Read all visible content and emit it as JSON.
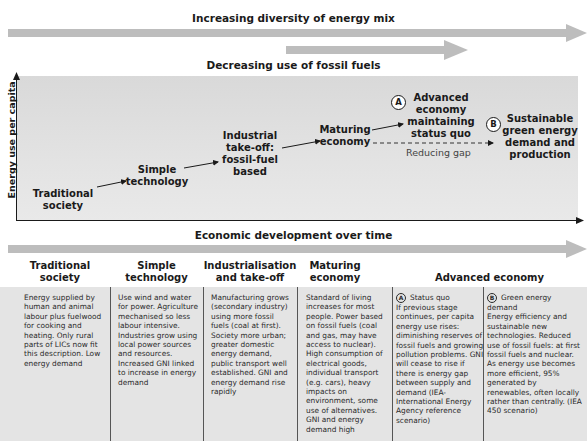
{
  "top_arrows": {
    "diversity": {
      "label": "Increasing diversity of energy mix",
      "color": "#bdbdbd"
    },
    "fossil": {
      "label": "Decreasing use of fossil fuels",
      "color": "#bdbdbd"
    }
  },
  "chart": {
    "y_axis_label": "Energy use per capita",
    "stages": [
      {
        "id": "traditional",
        "lines": [
          "Traditional",
          "society"
        ]
      },
      {
        "id": "simple",
        "lines": [
          "Simple",
          "technology"
        ]
      },
      {
        "id": "industrial",
        "lines": [
          "Industrial",
          "take-off:",
          "fossil-fuel",
          "based"
        ]
      },
      {
        "id": "maturing",
        "lines": [
          "Maturing",
          "economy"
        ]
      },
      {
        "id": "advanced-a",
        "marker": "A",
        "lines": [
          "Advanced",
          "economy",
          "maintaining",
          "status quo"
        ]
      },
      {
        "id": "sustainable-b",
        "marker": "B",
        "lines": [
          "Sustainable",
          "green energy",
          "demand and",
          "production"
        ]
      }
    ],
    "gap_label": "Reducing gap",
    "bg_color": "#dedede"
  },
  "timeline": {
    "label": "Economic development over time",
    "color": "#bdbdbd"
  },
  "table": {
    "headers": [
      {
        "lines": [
          "Traditional",
          "society"
        ]
      },
      {
        "lines": [
          "Simple",
          "technology"
        ]
      },
      {
        "lines": [
          "Industrialisation",
          "and take-off"
        ]
      },
      {
        "lines": [
          "Maturing",
          "economy"
        ]
      },
      {
        "lines": [
          "Advanced economy"
        ]
      }
    ],
    "cells": [
      {
        "text": "Energy supplied by human and animal labour plus fuelwood for cooking and heating. Only rural parts of LICs now fit this description. Low energy demand"
      },
      {
        "text": "Use wind and water for power.  Agriculture mechanised so less labour intensive. Industries grow using local power sources and resources. Increased GNI linked to increase in energy demand"
      },
      {
        "text": "Manufacturing grows (secondary industry) using more fossil fuels (coal at first). Society more urban; greater domestic energy demand, public transport well established. GNI and energy demand rise rapidly"
      },
      {
        "text": "Standard of living increases for most people. Power based on fossil fuels (coal and gas, may have access to nuclear). High consumption of electrical goods, individual transport (e.g. cars), heavy impacts on environment, some use of alternatives. GNI and energy demand high"
      },
      {
        "marker": "A",
        "title": "Status quo",
        "text": "If previous stage continues, per capita energy use rises: diminishing reserves of fossil fuels and growing pollution problems. GNI will cease to rise if there is energy gap between supply and demand (IEA-International Energy Agency reference scenario)"
      },
      {
        "marker": "B",
        "title": "Green energy demand",
        "text": "Energy efficiency and sustainable new technologies. Reduced use of fossil fuels: at first fossil fuels and nuclear. As energy use becomes more efficient, 95% generated by renewables, often locally rather than centrally. (IEA 450 scenario)"
      }
    ],
    "bg_color": "#e4e4e4"
  }
}
